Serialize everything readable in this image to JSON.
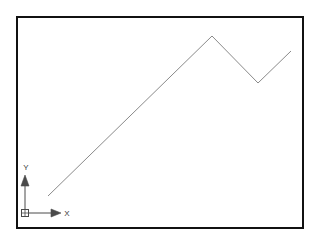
{
  "canvas": {
    "width": 319,
    "height": 245,
    "background_color": "#ffffff"
  },
  "viewport": {
    "name": "drawing-viewport",
    "border_color": "#111111",
    "border_width": 2,
    "fill_color": "#ffffff",
    "x": 16,
    "y": 16,
    "width": 288,
    "height": 213
  },
  "drawing": {
    "polyline": {
      "label": "polyline",
      "stroke_color": "#8a8a8a",
      "stroke_width": 1,
      "points": "48,196 212,36 258,83 291,51",
      "vertices": [
        {
          "name": "start",
          "x": 48,
          "y": 196
        },
        {
          "name": "peak",
          "x": 212,
          "y": 36
        },
        {
          "name": "valley",
          "x": 258,
          "y": 83
        },
        {
          "name": "end",
          "x": 291,
          "y": 51
        }
      ]
    }
  },
  "ucs_icon": {
    "name": "ucs-icon",
    "stroke_color": "#4a4a4a",
    "origin": {
      "x": 25,
      "y": 213
    },
    "origin_box": {
      "x": 21,
      "y": 209,
      "size": 8,
      "has_cross": true
    },
    "y_axis": {
      "label": "Y",
      "label_x": 26,
      "label_y": 170,
      "line_x": 25,
      "line_y1": 209,
      "line_y2": 184,
      "arrow_points": "25,175 21,186 29,186"
    },
    "x_axis": {
      "label": "X",
      "label_x": 67,
      "label_y": 216,
      "line_y": 213,
      "line_x1": 29,
      "line_x2": 52,
      "arrow_points": "61,213 51,209 51,217"
    }
  }
}
